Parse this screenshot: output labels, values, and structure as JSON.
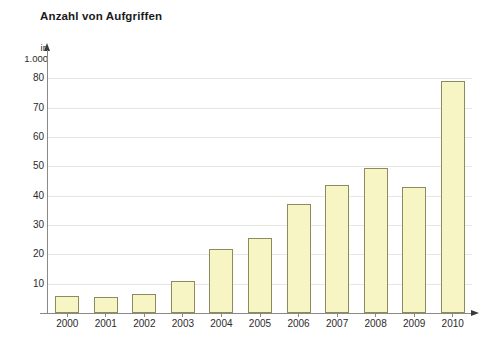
{
  "chart_data": {
    "type": "bar",
    "title": "Anzahl von Aufgriffen",
    "ylabel": "in 1.000",
    "ylabel_lines": [
      "in",
      "1.000"
    ],
    "xlabel": "",
    "categories": [
      "2000",
      "2001",
      "2002",
      "2003",
      "2004",
      "2005",
      "2006",
      "2007",
      "2008",
      "2009",
      "2010"
    ],
    "values": [
      5.8,
      5.3,
      6.5,
      11,
      21.8,
      25.5,
      37.3,
      43.5,
      49.5,
      43,
      79
    ],
    "ylim": [
      0,
      85
    ],
    "yticks": [
      10,
      20,
      30,
      40,
      50,
      60,
      70,
      80
    ],
    "ytick_labels": [
      "10",
      "20",
      "30",
      "40",
      "50",
      "60",
      "70",
      "80"
    ],
    "grid": true,
    "legend": "none",
    "series": [
      {
        "name": "Anzahl von Aufgriffen",
        "values": [
          5.8,
          5.3,
          6.5,
          11,
          21.8,
          25.5,
          37.3,
          43.5,
          49.5,
          43,
          79
        ]
      }
    ],
    "colors": {
      "bar_fill": "#f7f5c4",
      "bar_border": "#8d8a5f",
      "gridline": "#e6e6e2",
      "axis": "#8a8a82",
      "text": "#2b2b2b",
      "title": "#1a1a1a",
      "background": "#ffffff"
    }
  }
}
